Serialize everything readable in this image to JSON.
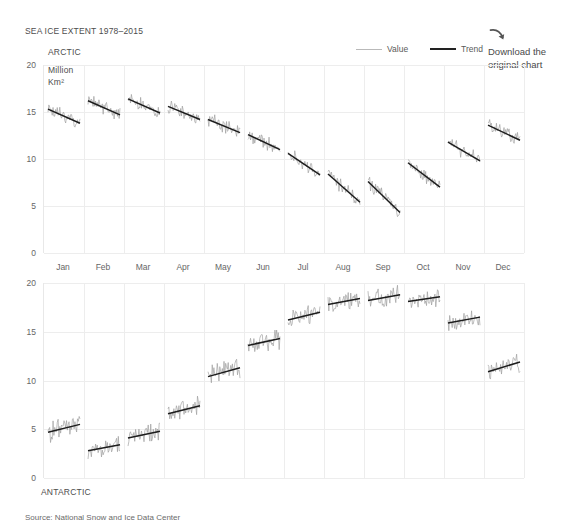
{
  "title": "SEA ICE EXTENT 1978–2015",
  "legend": {
    "position": "top-right",
    "items": [
      {
        "label": "Value",
        "style": "thin-light-line",
        "color": "#b9b9b9"
      },
      {
        "label": "Trend",
        "style": "thick-dark-line",
        "color": "#222222"
      }
    ]
  },
  "download": {
    "icon": "curved-arrow-icon",
    "line1": "Download the",
    "line2": "original chart"
  },
  "source": "Source: National Snow and Ice Data Center",
  "captions": {
    "arctic": "ARCTIC",
    "units_line1": "Million",
    "units_line2": "Km²",
    "antarctic": "ANTARCTIC"
  },
  "colors": {
    "value_line": "#9a9a9a",
    "trend_line": "#1c1c1c",
    "gridline": "#ededed",
    "text": "#5a5a5a",
    "background": "#ffffff"
  },
  "chart_data": [
    {
      "type": "line",
      "id": "arctic",
      "title": "ARCTIC",
      "ylabel": "Million Km²",
      "xlabel": "",
      "ylim": [
        0,
        20
      ],
      "yticks": [
        0,
        5,
        10,
        15,
        20
      ],
      "grid": true,
      "xcategories": [
        "Jan",
        "Feb",
        "Mar",
        "Apr",
        "May",
        "Jun",
        "Jul",
        "Aug",
        "Sep",
        "Oct",
        "Nov",
        "Dec"
      ],
      "note": "Each month is a separate sub-series of yearly values 1978-2015 with its own linear trend line.",
      "series": [
        {
          "name": "Trend",
          "description": "Linear trend start/end value per month panel",
          "segments": [
            {
              "month": "Jan",
              "start": 15.3,
              "end": 13.8
            },
            {
              "month": "Feb",
              "start": 16.2,
              "end": 14.7
            },
            {
              "month": "Mar",
              "start": 16.4,
              "end": 14.9
            },
            {
              "month": "Apr",
              "start": 15.6,
              "end": 14.2
            },
            {
              "month": "May",
              "start": 14.2,
              "end": 12.8
            },
            {
              "month": "Jun",
              "start": 12.6,
              "end": 11.0
            },
            {
              "month": "Jul",
              "start": 10.6,
              "end": 8.3
            },
            {
              "month": "Aug",
              "start": 8.4,
              "end": 5.4
            },
            {
              "month": "Sep",
              "start": 7.6,
              "end": 4.3
            },
            {
              "month": "Oct",
              "start": 9.6,
              "end": 7.0
            },
            {
              "month": "Nov",
              "start": 11.8,
              "end": 9.8
            },
            {
              "month": "Dec",
              "start": 13.6,
              "end": 12.0
            }
          ]
        },
        {
          "name": "Value",
          "description": "Noisy yearly observations oscillating around the trend",
          "noise_amplitude": 0.55
        }
      ]
    },
    {
      "type": "line",
      "id": "antarctic",
      "title": "ANTARCTIC",
      "ylabel": "Million Km²",
      "xlabel": "",
      "ylim": [
        0,
        20
      ],
      "yticks": [
        0,
        5,
        10,
        15,
        20
      ],
      "grid": true,
      "xcategories": [
        "Jan",
        "Feb",
        "Mar",
        "Apr",
        "May",
        "Jun",
        "Jul",
        "Aug",
        "Sep",
        "Oct",
        "Nov",
        "Dec"
      ],
      "note": "Each month is a separate sub-series of yearly values 1978-2015 with its own linear trend line.",
      "series": [
        {
          "name": "Trend",
          "description": "Linear trend start/end value per month panel",
          "segments": [
            {
              "month": "Jan",
              "start": 4.7,
              "end": 5.5
            },
            {
              "month": "Feb",
              "start": 2.8,
              "end": 3.4
            },
            {
              "month": "Mar",
              "start": 4.1,
              "end": 4.8
            },
            {
              "month": "Apr",
              "start": 6.6,
              "end": 7.4
            },
            {
              "month": "May",
              "start": 10.4,
              "end": 11.3
            },
            {
              "month": "Jun",
              "start": 13.6,
              "end": 14.3
            },
            {
              "month": "Jul",
              "start": 16.2,
              "end": 17.0
            },
            {
              "month": "Aug",
              "start": 17.8,
              "end": 18.4
            },
            {
              "month": "Sep",
              "start": 18.2,
              "end": 18.8
            },
            {
              "month": "Oct",
              "start": 18.1,
              "end": 18.6
            },
            {
              "month": "Nov",
              "start": 15.9,
              "end": 16.5
            },
            {
              "month": "Dec",
              "start": 10.9,
              "end": 11.9
            }
          ]
        },
        {
          "name": "Value",
          "description": "Noisy yearly observations oscillating around the trend",
          "noise_amplitude": 0.75
        }
      ]
    }
  ]
}
